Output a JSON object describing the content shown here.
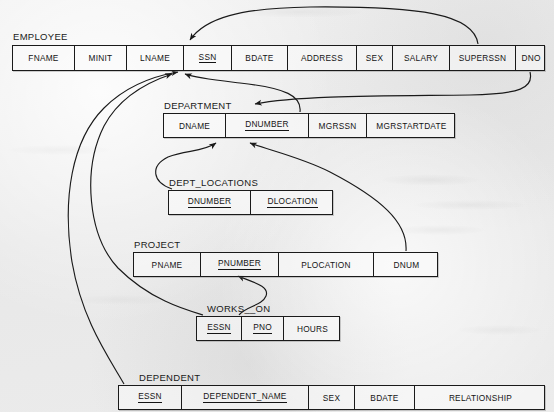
{
  "diagram": {
    "ink_color": "#1a1a1a",
    "paper_color": "#ececec"
  },
  "relations": [
    {
      "name": "EMPLOYEE",
      "x": 12,
      "y": 45,
      "width": 533,
      "height": 26,
      "label_x": 13,
      "label_y": 31,
      "attributes": [
        {
          "label": "FNAME",
          "key": false,
          "width": 62
        },
        {
          "label": "MINIT",
          "key": false,
          "width": 52
        },
        {
          "label": "LNAME",
          "key": false,
          "width": 57
        },
        {
          "label": "SSN",
          "key": true,
          "width": 48
        },
        {
          "label": "BDATE",
          "key": false,
          "width": 56
        },
        {
          "label": "ADDRESS",
          "key": false,
          "width": 69
        },
        {
          "label": "SEX",
          "key": false,
          "width": 36
        },
        {
          "label": "SALARY",
          "key": false,
          "width": 57
        },
        {
          "label": "SUPERSSN",
          "key": false,
          "width": 66
        },
        {
          "label": "DNO",
          "key": false,
          "width": 30
        }
      ]
    },
    {
      "name": "DEPARTMENT",
      "x": 163,
      "y": 113,
      "width": 292,
      "height": 25,
      "label_x": 164,
      "label_y": 100,
      "attributes": [
        {
          "label": "DNAME",
          "key": false,
          "width": 62
        },
        {
          "label": "DNUMBER",
          "key": true,
          "width": 83
        },
        {
          "label": "MGRSSN",
          "key": false,
          "width": 58
        },
        {
          "label": "MGRSTARTDATE",
          "key": false,
          "width": 89
        }
      ]
    },
    {
      "name": "DEPT_LOCATIONS",
      "x": 168,
      "y": 190,
      "width": 165,
      "height": 25,
      "label_x": 169,
      "label_y": 177,
      "attributes": [
        {
          "label": "DNUMBER",
          "key": true,
          "width": 82
        },
        {
          "label": "DLOCATION",
          "key": true,
          "width": 83
        }
      ]
    },
    {
      "name": "PROJECT",
      "x": 133,
      "y": 252,
      "width": 305,
      "height": 25,
      "label_x": 134,
      "label_y": 239,
      "attributes": [
        {
          "label": "PNAME",
          "key": false,
          "width": 67
        },
        {
          "label": "PNUMBER",
          "key": true,
          "width": 78
        },
        {
          "label": "PLOCATION",
          "key": false,
          "width": 95
        },
        {
          "label": "DNUM",
          "key": false,
          "width": 65
        }
      ]
    },
    {
      "name": "WORKS__ON",
      "x": 196,
      "y": 316,
      "width": 144,
      "height": 25,
      "label_x": 207,
      "label_y": 303,
      "attributes": [
        {
          "label": "ESSN",
          "key": true,
          "width": 45
        },
        {
          "label": "PNO",
          "key": true,
          "width": 42
        },
        {
          "label": "HOURS",
          "key": false,
          "width": 57
        }
      ]
    },
    {
      "name": "DEPENDENT",
      "x": 118,
      "y": 385,
      "width": 427,
      "height": 25,
      "label_x": 139,
      "label_y": 372,
      "attributes": [
        {
          "label": "ESSN",
          "key": true,
          "width": 63
        },
        {
          "label": "DEPENDENT_NAME",
          "key": true,
          "width": 127
        },
        {
          "label": "SEX",
          "key": false,
          "width": 46
        },
        {
          "label": "BDATE",
          "key": false,
          "width": 60
        },
        {
          "label": "RELATIONSHIP",
          "key": false,
          "width": 131
        }
      ]
    }
  ],
  "foreign_keys": [
    {
      "from": "EMPLOYEE.SUPERSSN",
      "to": "EMPLOYEE.SSN"
    },
    {
      "from": "EMPLOYEE.DNO",
      "to": "DEPARTMENT.DNUMBER"
    },
    {
      "from": "DEPARTMENT.MGRSSN",
      "to": "EMPLOYEE.SSN"
    },
    {
      "from": "DEPT_LOCATIONS.DNUMBER",
      "to": "DEPARTMENT.DNUMBER"
    },
    {
      "from": "PROJECT.DNUM",
      "to": "DEPARTMENT.DNUMBER"
    },
    {
      "from": "WORKS__ON.ESSN",
      "to": "EMPLOYEE.SSN"
    },
    {
      "from": "WORKS__ON.PNO",
      "to": "PROJECT.PNUMBER"
    },
    {
      "from": "DEPENDENT.ESSN",
      "to": "EMPLOYEE.SSN"
    }
  ]
}
